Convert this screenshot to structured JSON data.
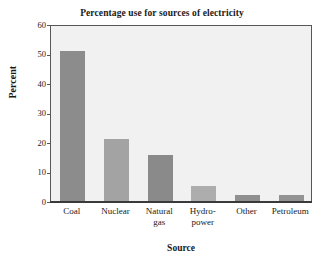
{
  "chart_data": {
    "type": "bar",
    "title": "Percentage use for sources of electricity",
    "xlabel": "Source",
    "ylabel": "Percent",
    "categories": [
      "Coal",
      "Nuclear",
      "Natural\ngas",
      "Hydro-\npower",
      "Other",
      "Petroleum"
    ],
    "category_labels_flat": [
      "Coal",
      "Nuclear",
      "Natural gas",
      "Hydro-power",
      "Other",
      "Petroleum"
    ],
    "values": [
      51,
      21,
      15.5,
      5.2,
      2.2,
      2
    ],
    "ylim": [
      0,
      60
    ],
    "yticks": [
      0,
      10,
      20,
      30,
      40,
      50,
      60
    ],
    "ytick_labels": [
      "0",
      "10",
      "20",
      "30",
      "40",
      "50",
      "60"
    ],
    "grid": false,
    "legend": "none",
    "bar_colors": [
      "#8c8c8c",
      "#a3a3a3",
      "#8a8a8a",
      "#adadad",
      "#8f8f8f",
      "#939393"
    ],
    "plot_background": "#f1f1f1",
    "frame_color": "#575757",
    "text_color": "#1a1a1a"
  }
}
